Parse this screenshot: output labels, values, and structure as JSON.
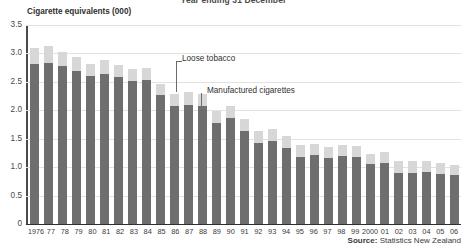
{
  "chart_data": {
    "type": "bar",
    "title": "Year ending 31 December",
    "ylabel": "Cigarette equivalents (000)",
    "xlabel": "",
    "ylim": [
      0,
      3.5
    ],
    "yticks": [
      "0",
      "0.5",
      "1.0",
      "1.5",
      "2.0",
      "2.5",
      "3.0",
      "3.5"
    ],
    "ytick_values": [
      0,
      0.5,
      1.0,
      1.5,
      2.0,
      2.5,
      3.0,
      3.5
    ],
    "grid": true,
    "stacked": true,
    "legend_position": "annotations-inline",
    "categories": [
      "1976",
      "77",
      "78",
      "79",
      "80",
      "81",
      "82",
      "83",
      "84",
      "85",
      "86",
      "87",
      "88",
      "89",
      "90",
      "91",
      "92",
      "93",
      "94",
      "95",
      "96",
      "97",
      "98",
      "99",
      "2000",
      "01",
      "02",
      "03",
      "04",
      "05",
      "06"
    ],
    "series": [
      {
        "name": "Manufactured cigarettes",
        "color": "#6e6e6e",
        "values": [
          2.82,
          2.84,
          2.78,
          2.69,
          2.6,
          2.64,
          2.58,
          2.52,
          2.54,
          2.27,
          2.07,
          2.1,
          2.07,
          1.78,
          1.86,
          1.64,
          1.42,
          1.46,
          1.33,
          1.18,
          1.21,
          1.16,
          1.2,
          1.18,
          1.05,
          1.07,
          0.9,
          0.9,
          0.91,
          0.88,
          0.86
        ]
      },
      {
        "name": "Loose tobacco",
        "color": "#d7d7d7",
        "values": [
          0.28,
          0.29,
          0.24,
          0.25,
          0.22,
          0.24,
          0.21,
          0.21,
          0.21,
          0.2,
          0.21,
          0.22,
          0.22,
          0.21,
          0.21,
          0.2,
          0.22,
          0.22,
          0.21,
          0.21,
          0.2,
          0.2,
          0.19,
          0.2,
          0.19,
          0.19,
          0.21,
          0.2,
          0.2,
          0.19,
          0.18
        ]
      }
    ],
    "annotations": [
      {
        "label": "Loose tobacco",
        "target_series": "Loose tobacco"
      },
      {
        "label": "Manufactured cigarettes",
        "target_series": "Manufactured cigarettes"
      }
    ]
  },
  "source": {
    "prefix": "Source:",
    "text": " Statistics New Zealand"
  }
}
